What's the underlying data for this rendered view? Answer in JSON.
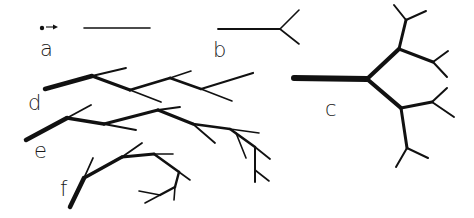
{
  "figure": {
    "title": "",
    "stroke_color": "#111111",
    "background": "#ffffff"
  },
  "panels": [
    {
      "id": "a",
      "label": "a",
      "label_pos": [
        40,
        56
      ],
      "description": "single unbranched segment with starting point and growth arrow",
      "segments": [
        {
          "from": [
            84,
            28
          ],
          "to": [
            150,
            28
          ],
          "w": 1.6
        }
      ],
      "dot": [
        42,
        28
      ],
      "arrow": {
        "from": [
          46,
          27
        ],
        "to": [
          58,
          27
        ]
      }
    },
    {
      "id": "b",
      "label": "b",
      "label_pos": [
        213,
        57
      ],
      "description": "segment with a single bifurcation",
      "segments": [
        {
          "from": [
            218,
            29
          ],
          "to": [
            280,
            29
          ],
          "w": 1.8
        },
        {
          "from": [
            280,
            29
          ],
          "to": [
            299,
            10
          ],
          "w": 1.6
        },
        {
          "from": [
            280,
            29
          ],
          "to": [
            299,
            44
          ],
          "w": 1.6
        }
      ]
    },
    {
      "id": "c",
      "label": "c",
      "label_pos": [
        325,
        116
      ],
      "description": "symmetric dichotomous branching, three generations",
      "segments": [
        {
          "from": [
            294,
            78
          ],
          "to": [
            367,
            79
          ],
          "w": 6
        },
        {
          "from": [
            367,
            79
          ],
          "to": [
            399,
            49
          ],
          "w": 4.2
        },
        {
          "from": [
            367,
            79
          ],
          "to": [
            401,
            108
          ],
          "w": 4.2
        },
        {
          "from": [
            399,
            49
          ],
          "to": [
            406,
            20
          ],
          "w": 3
        },
        {
          "from": [
            399,
            49
          ],
          "to": [
            433,
            62
          ],
          "w": 3
        },
        {
          "from": [
            401,
            108
          ],
          "to": [
            432,
            102
          ],
          "w": 3
        },
        {
          "from": [
            401,
            108
          ],
          "to": [
            407,
            148
          ],
          "w": 3
        },
        {
          "from": [
            406,
            20
          ],
          "to": [
            394,
            5
          ],
          "w": 2
        },
        {
          "from": [
            406,
            20
          ],
          "to": [
            426,
            11
          ],
          "w": 2
        },
        {
          "from": [
            433,
            62
          ],
          "to": [
            448,
            51
          ],
          "w": 2
        },
        {
          "from": [
            433,
            62
          ],
          "to": [
            447,
            77
          ],
          "w": 2
        },
        {
          "from": [
            432,
            102
          ],
          "to": [
            447,
            88
          ],
          "w": 2
        },
        {
          "from": [
            432,
            102
          ],
          "to": [
            454,
            117
          ],
          "w": 2
        },
        {
          "from": [
            407,
            148
          ],
          "to": [
            396,
            167
          ],
          "w": 2
        },
        {
          "from": [
            407,
            148
          ],
          "to": [
            428,
            158
          ],
          "w": 2
        }
      ]
    },
    {
      "id": "d",
      "label": "d",
      "label_pos": [
        28,
        110
      ],
      "description": "monopodial zigzag branching with alternating side branches",
      "segments": [
        {
          "from": [
            45,
            89
          ],
          "to": [
            92,
            76
          ],
          "w": 4.5
        },
        {
          "from": [
            92,
            76
          ],
          "to": [
            126,
            68
          ],
          "w": 1.8
        },
        {
          "from": [
            92,
            76
          ],
          "to": [
            130,
            90
          ],
          "w": 3.2
        },
        {
          "from": [
            130,
            90
          ],
          "to": [
            161,
            102
          ],
          "w": 1.8
        },
        {
          "from": [
            130,
            90
          ],
          "to": [
            170,
            78
          ],
          "w": 2.8
        },
        {
          "from": [
            170,
            78
          ],
          "to": [
            191,
            71
          ],
          "w": 1.6
        },
        {
          "from": [
            170,
            78
          ],
          "to": [
            201,
            89
          ],
          "w": 2.6
        },
        {
          "from": [
            201,
            89
          ],
          "to": [
            232,
            101
          ],
          "w": 1.6
        },
        {
          "from": [
            201,
            89
          ],
          "to": [
            253,
            73
          ],
          "w": 2.2
        }
      ]
    },
    {
      "id": "e",
      "label": "e",
      "label_pos": [
        34,
        158
      ],
      "description": "branching axis with secondary branching on lateral shoots",
      "segments": [
        {
          "from": [
            26,
            140
          ],
          "to": [
            67,
            118
          ],
          "w": 4.5
        },
        {
          "from": [
            67,
            118
          ],
          "to": [
            91,
            105
          ],
          "w": 1.8
        },
        {
          "from": [
            67,
            118
          ],
          "to": [
            104,
            124
          ],
          "w": 3.4
        },
        {
          "from": [
            104,
            124
          ],
          "to": [
            136,
            130
          ],
          "w": 1.8
        },
        {
          "from": [
            104,
            124
          ],
          "to": [
            158,
            110
          ],
          "w": 3
        },
        {
          "from": [
            158,
            110
          ],
          "to": [
            180,
            107
          ],
          "w": 1.8
        },
        {
          "from": [
            158,
            110
          ],
          "to": [
            193,
            124
          ],
          "w": 3
        },
        {
          "from": [
            193,
            124
          ],
          "to": [
            215,
            143
          ],
          "w": 1.8
        },
        {
          "from": [
            193,
            124
          ],
          "to": [
            230,
            129
          ],
          "w": 2.6
        },
        {
          "from": [
            230,
            129
          ],
          "to": [
            259,
            133
          ],
          "w": 1.6
        },
        {
          "from": [
            230,
            129
          ],
          "to": [
            255,
            147
          ],
          "w": 2.6
        },
        {
          "from": [
            236,
            133
          ],
          "to": [
            246,
            158
          ],
          "w": 1.6
        },
        {
          "from": [
            255,
            147
          ],
          "to": [
            270,
            159
          ],
          "w": 1.8
        },
        {
          "from": [
            255,
            147
          ],
          "to": [
            255,
            182
          ],
          "w": 2
        },
        {
          "from": [
            255,
            170
          ],
          "to": [
            269,
            181
          ],
          "w": 1.6
        }
      ]
    },
    {
      "id": "f",
      "label": "f",
      "label_pos": [
        60,
        196
      ],
      "description": "curving sympodial branch",
      "segments": [
        {
          "from": [
            70,
            207
          ],
          "to": [
            84,
            178
          ],
          "w": 4.5
        },
        {
          "from": [
            84,
            178
          ],
          "to": [
            93,
            158
          ],
          "w": 1.8
        },
        {
          "from": [
            84,
            178
          ],
          "to": [
            122,
            157
          ],
          "w": 3.4
        },
        {
          "from": [
            122,
            157
          ],
          "to": [
            142,
            143
          ],
          "w": 1.8
        },
        {
          "from": [
            122,
            157
          ],
          "to": [
            154,
            154
          ],
          "w": 3
        },
        {
          "from": [
            154,
            154
          ],
          "to": [
            173,
            154
          ],
          "w": 1.6
        },
        {
          "from": [
            154,
            154
          ],
          "to": [
            179,
            172
          ],
          "w": 2.6
        },
        {
          "from": [
            179,
            172
          ],
          "to": [
            190,
            180
          ],
          "w": 1.6
        },
        {
          "from": [
            179,
            172
          ],
          "to": [
            175,
            187
          ],
          "w": 2.4
        },
        {
          "from": [
            175,
            187
          ],
          "to": [
            174,
            200
          ],
          "w": 1.6
        },
        {
          "from": [
            175,
            187
          ],
          "to": [
            160,
            195
          ],
          "w": 2.4
        },
        {
          "from": [
            160,
            195
          ],
          "to": [
            139,
            191
          ],
          "w": 1.6
        },
        {
          "from": [
            160,
            195
          ],
          "to": [
            145,
            203
          ],
          "w": 1.6
        }
      ]
    }
  ]
}
